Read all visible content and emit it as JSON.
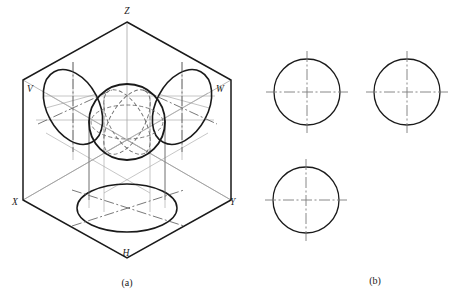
{
  "figure": {
    "panels": [
      {
        "id": "panel-a",
        "caption": "(a)",
        "description": "Axonometric view of the three-plane projection box containing a sphere",
        "labels": [
          {
            "name": "axis-label-z",
            "text": "Z",
            "x": 127,
            "y": 14
          },
          {
            "name": "plane-label-v",
            "text": "V",
            "x": 27,
            "y": 92
          },
          {
            "name": "plane-label-w",
            "text": "W",
            "x": 216,
            "y": 92
          },
          {
            "name": "axis-label-x",
            "text": "X",
            "x": 12,
            "y": 205
          },
          {
            "name": "axis-label-y",
            "text": "Y",
            "x": 230,
            "y": 205
          },
          {
            "name": "plane-label-h",
            "text": "H",
            "x": 126,
            "y": 256
          }
        ]
      },
      {
        "id": "panel-b",
        "caption": "(b)",
        "description": "Three orthographic views, each a circle with centre lines",
        "views": [
          {
            "name": "front-view-circle",
            "cx": 307,
            "cy": 92,
            "r": 33
          },
          {
            "name": "side-view-circle",
            "cx": 407,
            "cy": 92,
            "r": 33
          },
          {
            "name": "top-view-circle",
            "cx": 306,
            "cy": 200,
            "r": 33
          }
        ]
      }
    ],
    "colors": {
      "outline": "#1a1a1a",
      "construction": "#9a9a9a",
      "hidden": "#6f6f6f",
      "centerline": "#808080",
      "background": "#ffffff"
    },
    "geometry": {
      "box": {
        "top_apex": {
          "x": 127,
          "y": 22
        },
        "left_upper": {
          "x": 23,
          "y": 80
        },
        "right_upper": {
          "x": 231,
          "y": 80
        },
        "left_lower": {
          "x": 23,
          "y": 200
        },
        "right_lower": {
          "x": 231,
          "y": 200
        },
        "bottom_apex": {
          "x": 127,
          "y": 258
        },
        "center": {
          "x": 127,
          "y": 140
        }
      },
      "sphere": {
        "cx": 127,
        "cy": 122,
        "r": 38
      },
      "v_ellipse": {
        "cx": 73,
        "cy": 107,
        "rx": 26,
        "ry": 40,
        "rotate": -28
      },
      "w_ellipse": {
        "cx": 182,
        "cy": 107,
        "rx": 26,
        "ry": 40,
        "rotate": 28
      },
      "h_ellipse": {
        "cx": 127,
        "cy": 208,
        "rx": 50,
        "ry": 24
      }
    }
  }
}
